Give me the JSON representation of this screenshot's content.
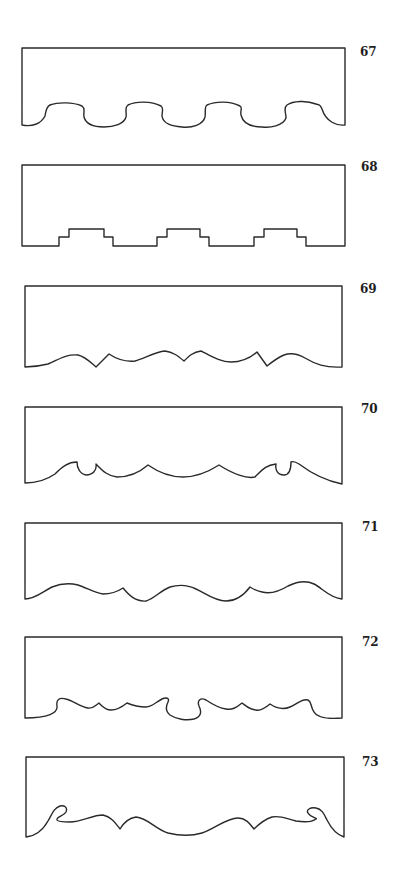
{
  "figure": {
    "stroke_color": "#2a2a2a",
    "background": "#ffffff",
    "patterns": [
      {
        "number": "67",
        "style": "alternating round scallops"
      },
      {
        "number": "68",
        "style": "stepped (crenellated) tabs"
      },
      {
        "number": "69",
        "style": "wavy with pointed notches"
      },
      {
        "number": "70",
        "style": "swags with small curled loops"
      },
      {
        "number": "71",
        "style": "waves with cusps"
      },
      {
        "number": "72",
        "style": "scrolled waves with small cusps"
      },
      {
        "number": "73",
        "style": "swags with end curls"
      }
    ]
  }
}
